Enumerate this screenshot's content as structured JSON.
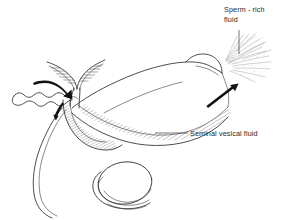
{
  "figure": {
    "background_color": "#ffffff",
    "line_color": "#2e2e33",
    "text_color": "#26262a",
    "spray_color": "#9a9aa2",
    "arrow_color": "#111114",
    "width": 291,
    "height": 220
  },
  "labels": {
    "sperm_rich": {
      "line1": "Sperm - rich",
      "line2": "fluid",
      "x": 224,
      "y": 12
    },
    "seminal": {
      "line1": "Seminal vesical fluid",
      "x": 190,
      "y": 135
    }
  },
  "annotations": {
    "flow_arrow_in_label": "epididymal-flow-arrow",
    "flow_arrow_duct_label": "vas-deferens-flow-arrow",
    "flow_arrow_urethra_label": "urethral-flow-arrow"
  },
  "structures": {
    "epididymis": "coiled-epididymis",
    "seminal_vesicles": "seminal-vesicle-pair",
    "prostate": "prostate-body",
    "urethra": "hatched-urethral-band",
    "glans": "glans-penis",
    "testis": "testis-oval",
    "scrotum": "scrotal-outline",
    "vas_deferens": "vas-deferens-tube",
    "ejaculate": "sperm-spray"
  }
}
